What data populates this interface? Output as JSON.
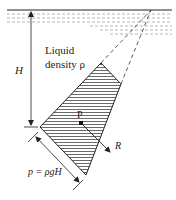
{
  "diagram": {
    "labels": {
      "depth": "H",
      "liquid_line1": "Liquid",
      "liquid_line2": "density ρ",
      "point": "P",
      "resultant": "R",
      "pressure": "p = ρgH"
    },
    "colors": {
      "line": "#222222",
      "hatch": "#444444",
      "background": "#ffffff",
      "liquid_dash": "#666666"
    }
  }
}
